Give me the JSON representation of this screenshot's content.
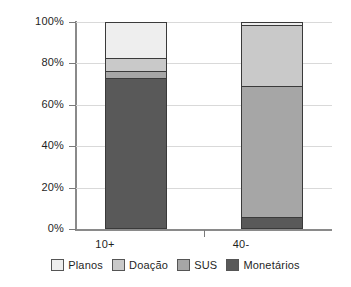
{
  "chart_data": {
    "type": "bar",
    "variant": "stacked-100-percent",
    "title": "",
    "subtitle": "",
    "xlabel": "",
    "ylabel": "",
    "categories": [
      "10+",
      "40-"
    ],
    "ylim": [
      0,
      100
    ],
    "y_ticks": [
      0,
      20,
      40,
      60,
      80,
      100
    ],
    "y_tick_labels": [
      "0%",
      "20%",
      "40%",
      "60%",
      "80%",
      "100%"
    ],
    "grid": true,
    "grid_axis": "y",
    "legend_position": "bottom",
    "stack_order_bottom_to_top": [
      "Monetários",
      "SUS",
      "Doação",
      "Planos"
    ],
    "series": [
      {
        "name": "Planos",
        "color": "#eeeeee",
        "values": [
          17.5,
          1.5
        ]
      },
      {
        "name": "Doação",
        "color": "#c9c9c9",
        "values": [
          6.5,
          29.5
        ]
      },
      {
        "name": "SUS",
        "color": "#a6a6a6",
        "values": [
          3.5,
          64.0
        ]
      },
      {
        "name": "Monetários",
        "color": "#595959",
        "values": [
          72.5,
          5.0
        ]
      }
    ]
  },
  "axes": {
    "y_labels": [
      "100%",
      "80%",
      "60%",
      "40%",
      "20%",
      "0%"
    ],
    "x_labels": [
      "10+",
      "40-"
    ]
  },
  "legend": {
    "items": [
      {
        "label": "Planos",
        "color": "#eeeeee"
      },
      {
        "label": "Doação",
        "color": "#c9c9c9"
      },
      {
        "label": "SUS",
        "color": "#a6a6a6"
      },
      {
        "label": "Monetários",
        "color": "#595959"
      }
    ]
  },
  "colors": {
    "grid": "#d9d9d9",
    "axis": "#8a8a8a",
    "bar_border": "#3a3a3a",
    "text": "#1f1f1f",
    "background": "#ffffff"
  }
}
